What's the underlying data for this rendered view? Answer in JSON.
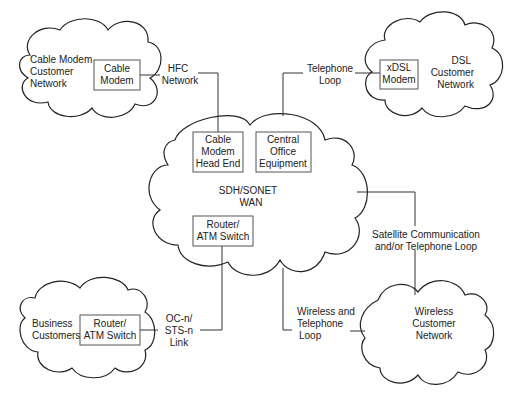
{
  "diagram": {
    "clouds": {
      "cable_customer": {
        "label": [
          "Cable Modem",
          "Customer",
          "Network"
        ]
      },
      "dsl_customer": {
        "label": [
          "DSL",
          "Customer",
          "Network"
        ]
      },
      "wan": {
        "label": [
          "SDH/SONET",
          "WAN"
        ]
      },
      "business": {
        "label": [
          "Business",
          "Customers"
        ]
      },
      "wireless": {
        "label": [
          "Wireless",
          "Customer",
          "Network"
        ]
      }
    },
    "boxes": {
      "cable_modem": {
        "label": [
          "Cable",
          "Modem"
        ]
      },
      "xdsl_modem": {
        "label": [
          "xDSL",
          "Modem"
        ]
      },
      "head_end": {
        "label": [
          "Cable",
          "Modem",
          "Head End"
        ]
      },
      "central_office": {
        "label": [
          "Central",
          "Office",
          "Equipment"
        ]
      },
      "wan_router": {
        "label": [
          "Router/",
          "ATM Switch"
        ]
      },
      "business_router": {
        "label": [
          "Router/",
          "ATM Switch"
        ]
      }
    },
    "links": {
      "hfc": {
        "label": [
          "HFC",
          "Network"
        ]
      },
      "telephone": {
        "label": [
          "Telephone",
          "Loop"
        ]
      },
      "satellite": {
        "label": [
          "Satellite Communication",
          "and/or Telephone Loop"
        ]
      },
      "ocn": {
        "label": [
          "OC-n/",
          "STS-n",
          "Link"
        ]
      },
      "wireless_loop": {
        "label": [
          "Wireless and",
          "Telephone",
          "Loop"
        ]
      }
    }
  }
}
